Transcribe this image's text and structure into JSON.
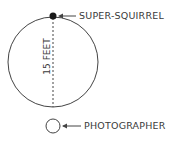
{
  "diagram": {
    "labels": {
      "squirrel": "SUPER-SQUIRREL",
      "photographer": "PHOTOGRAPHER",
      "diameter": "15 FEET"
    },
    "colors": {
      "line": "#444444",
      "text": "#3a3a3a",
      "dot": "#1a1a1a"
    }
  }
}
